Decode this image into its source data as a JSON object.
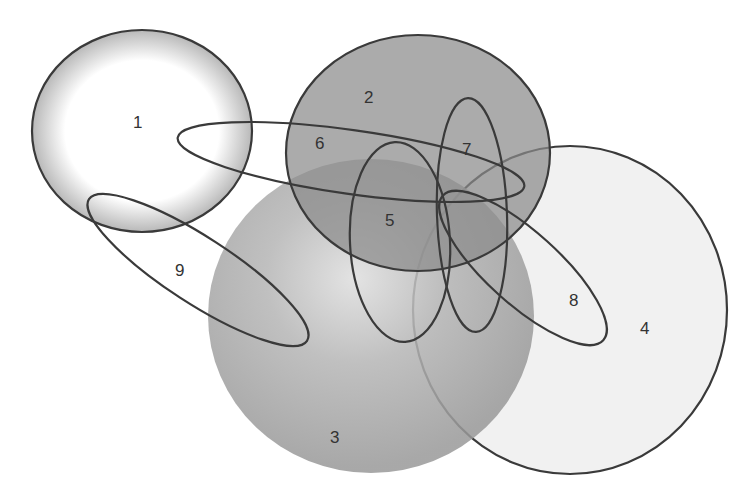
{
  "diagram": {
    "type": "venn",
    "sets": [
      {
        "id": "1",
        "label": "1",
        "shape": "circle",
        "cx": 142,
        "cy": 131,
        "rx": 110,
        "ry": 101,
        "rotate": 0,
        "fill": "#ffffff",
        "edge_shade": "#bdbdbd",
        "opacity": 1
      },
      {
        "id": "2",
        "label": "2",
        "shape": "circle",
        "cx": 418,
        "cy": 153,
        "rx": 132,
        "ry": 118,
        "rotate": 0,
        "fill": "#8a8a8a",
        "opacity": 0.72
      },
      {
        "id": "3",
        "label": "3",
        "shape": "circle",
        "cx": 371,
        "cy": 316,
        "rx": 163,
        "ry": 157,
        "rotate": 0,
        "fill": "#9a9a9a",
        "center_shade": "#dcdcdc",
        "opacity": 0.85
      },
      {
        "id": "4",
        "label": "4",
        "shape": "circle",
        "cx": 570,
        "cy": 310,
        "rx": 157,
        "ry": 164,
        "rotate": 0,
        "fill": "#e6e6e6",
        "opacity": 0.55
      },
      {
        "id": "5",
        "label": "5",
        "shape": "ellipse",
        "cx": 400,
        "cy": 242,
        "rx": 50,
        "ry": 100,
        "rotate": -3
      },
      {
        "id": "6",
        "label": "6",
        "shape": "ellipse",
        "cx": 351,
        "cy": 162,
        "rx": 175,
        "ry": 32,
        "rotate": 8
      },
      {
        "id": "7",
        "label": "7",
        "shape": "ellipse",
        "cx": 472,
        "cy": 215,
        "rx": 35,
        "ry": 117,
        "rotate": -2
      },
      {
        "id": "8",
        "label": "8",
        "shape": "ellipse",
        "cx": 523,
        "cy": 268,
        "rx": 108,
        "ry": 36,
        "rotate": 42
      },
      {
        "id": "9",
        "label": "9",
        "shape": "ellipse",
        "cx": 198,
        "cy": 270,
        "rx": 130,
        "ry": 33,
        "rotate": 33
      }
    ],
    "labels": [
      {
        "text": "1",
        "x": 133,
        "y": 128
      },
      {
        "text": "2",
        "x": 364,
        "y": 103
      },
      {
        "text": "3",
        "x": 330,
        "y": 443
      },
      {
        "text": "4",
        "x": 640,
        "y": 334
      },
      {
        "text": "5",
        "x": 385,
        "y": 226
      },
      {
        "text": "6",
        "x": 315,
        "y": 149
      },
      {
        "text": "7",
        "x": 462,
        "y": 155
      },
      {
        "text": "8",
        "x": 569,
        "y": 306
      },
      {
        "text": "9",
        "x": 175,
        "y": 276
      }
    ]
  }
}
